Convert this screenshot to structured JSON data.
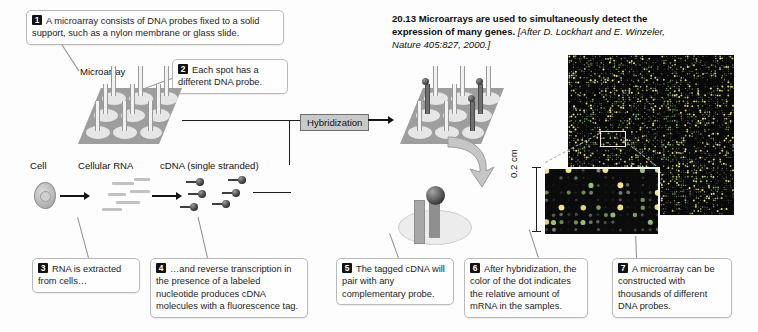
{
  "figure": {
    "number": "20.13",
    "title_bold": "Microarrays are used to simultaneously detect the expression of many genes.",
    "credit_italic": "[After D. Lockhart and E. Winzeler,",
    "credit_rest": "Nature 405:827, 2000.]"
  },
  "labels": {
    "microarray": "Microarray",
    "cell": "Cell",
    "cellular_rna": "Cellular RNA",
    "cdna": "cDNA (single stranded)",
    "hybridization": "Hybridization",
    "scale": "0.2 cm"
  },
  "callouts": [
    {
      "num": "1",
      "text": "A microarray consists of DNA probes fixed to a solid support, such as a nylon membrane or glass slide."
    },
    {
      "num": "2",
      "text": "Each spot has a different DNA probe."
    },
    {
      "num": "3",
      "text": "RNA is extracted from cells…"
    },
    {
      "num": "4",
      "text": "…and reverse transcription in the presence of a labeled nucleotide produces cDNA molecules with a fluorescence tag."
    },
    {
      "num": "5",
      "text": "The tagged cDNA will pair with any complementary probe."
    },
    {
      "num": "6",
      "text": "After hybridization, the color of the dot indicates the relative amount of mRNA in the samples."
    },
    {
      "num": "7",
      "text": "A microarray can be constructed with thousands of different DNA probes."
    }
  ],
  "colors": {
    "plate_gray": "#9e9e9e",
    "spot_light": "#e6e6e6",
    "callout_border": "#b9b9b9",
    "number_badge": "#111111",
    "hyb_fill": "#c9c9c9",
    "photo_black": "#060606"
  }
}
